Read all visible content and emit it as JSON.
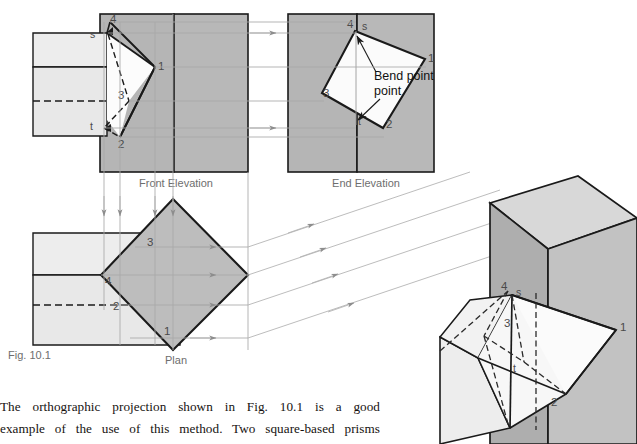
{
  "figure": {
    "caption": "Fig. 10.1",
    "views": {
      "front_elevation": "Front Elevation",
      "end_elevation": "End Elevation",
      "plan": "Plan"
    },
    "annotations": {
      "bend_point": "Bend point"
    },
    "vertex_labels": {
      "front_elevation": [
        "4",
        "s",
        "1",
        "3",
        "t",
        "2"
      ],
      "end_elevation": [
        "4",
        "s",
        "1",
        "3",
        "t",
        "2"
      ],
      "plan": [
        "3",
        "4",
        "2",
        "1"
      ],
      "pictorial": [
        "4",
        "s",
        "3",
        "1",
        "t",
        "2"
      ]
    }
  },
  "body_text": {
    "line1": "The orthographic projection shown in Fig. 10.1 is a good",
    "line2": "example of the use of this method. Two square-based prisms"
  },
  "colors": {
    "outline": "#1a1a1a",
    "mid_gray": "#b5b5b5",
    "light_gray": "#e4e4e4",
    "pale_gray": "#ededed",
    "white_face": "#fbfbfb",
    "projection_line": "#a8a8a8",
    "label_gray": "#6e6e6e",
    "text_black": "#16120f"
  }
}
